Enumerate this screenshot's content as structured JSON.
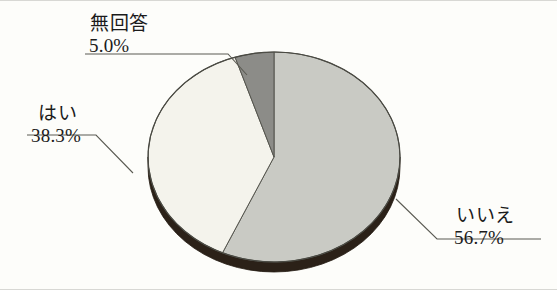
{
  "figure": {
    "background_color": "#fdfdfa",
    "border_color": "#d8d8d4"
  },
  "chart_data": {
    "type": "pie",
    "title": "",
    "subtitle": "",
    "xlabel": "",
    "ylabel": "",
    "legend_position": "none",
    "grid": false,
    "style": "3d-pie-with-leader-lines",
    "start_angle_deg": 0,
    "direction": "clockwise",
    "categories": [
      "いいえ",
      "はい",
      "無回答"
    ],
    "values": [
      56.7,
      38.3,
      5.0
    ],
    "value_unit": "%",
    "slice_colors": [
      "#c9cac4",
      "#f4f3ec",
      "#8c8c88"
    ],
    "edge_color": "#3a3a34",
    "depth_color": "#2b2118",
    "slices": [
      {
        "label": "いいえ",
        "value": 56.7,
        "value_text": "56.7%",
        "color": "#c9cac4",
        "start_deg": 0,
        "end_deg": 204.12
      },
      {
        "label": "はい",
        "value": 38.3,
        "value_text": "38.3%",
        "color": "#f4f3ec",
        "start_deg": 204.12,
        "end_deg": 342.0
      },
      {
        "label": "無回答",
        "value": 5.0,
        "value_text": "5.0%",
        "color": "#8c8c88",
        "start_deg": 342.0,
        "end_deg": 360.0
      }
    ]
  },
  "labels": {
    "nokaito": {
      "category": "無回答",
      "percent": "5.0%"
    },
    "hai": {
      "category": "はい",
      "percent": "38.3%"
    },
    "iie": {
      "category": "いいえ",
      "percent": "56.7%"
    }
  }
}
